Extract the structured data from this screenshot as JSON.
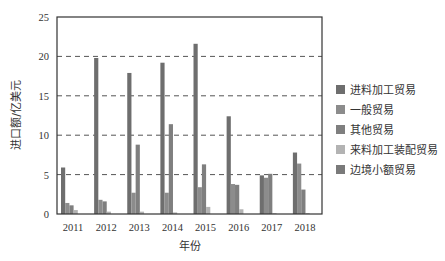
{
  "chart_data": {
    "type": "bar",
    "title": "",
    "xlabel": "年份",
    "ylabel": "进口额/亿美元",
    "ylim": [
      0,
      25
    ],
    "yticks": [
      0,
      5,
      10,
      15,
      20,
      25
    ],
    "grid": "horizontal dashed at 5, 10, 15, 20",
    "legend_position": "right",
    "categories": [
      "2011",
      "2012",
      "2013",
      "2014",
      "2015",
      "2016",
      "2017",
      "2018"
    ],
    "series": [
      {
        "name": "进料加工贸易",
        "color": "#6e6e6e",
        "values": [
          5.9,
          19.8,
          17.9,
          19.2,
          21.6,
          12.4,
          4.9,
          7.8
        ]
      },
      {
        "name": "一般贸易",
        "color": "#8c8c8c",
        "values": [
          1.4,
          1.8,
          2.7,
          2.7,
          3.4,
          3.8,
          4.6,
          6.4
        ]
      },
      {
        "name": "其他贸易",
        "color": "#7f7f7f",
        "values": [
          1.1,
          1.6,
          8.8,
          11.4,
          6.3,
          3.7,
          5.1,
          3.1
        ]
      },
      {
        "name": "来料加工装配贸易",
        "color": "#b3b3b3",
        "values": [
          0.5,
          0.3,
          0.3,
          0.2,
          0.9,
          0.6,
          0.1,
          0.1
        ]
      },
      {
        "name": "边境小额贸易",
        "color": "#7a7a7a",
        "values": [
          0.0,
          0.0,
          0.0,
          0.0,
          0.0,
          0.0,
          0.0,
          0.0
        ]
      }
    ]
  }
}
